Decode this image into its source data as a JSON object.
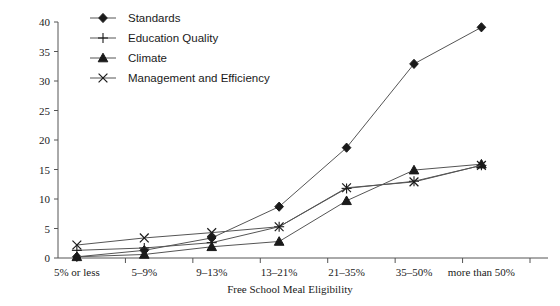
{
  "chart_data": {
    "type": "line",
    "title": "",
    "xlabel": "Free School Meal Eligibility",
    "ylabel": "",
    "ylim": [
      0,
      40
    ],
    "ytick_step": 5,
    "yticks": [
      0,
      5,
      10,
      15,
      20,
      25,
      30,
      35,
      40
    ],
    "grid": false,
    "legend_position": "top-left",
    "categories": [
      "5% or less",
      "5–9%",
      "9–13%",
      "13–21%",
      "21–35%",
      "35–50%",
      "more than 50%"
    ],
    "series": [
      {
        "name": "Standards",
        "marker": "diamond",
        "color": "#1a1a1a",
        "values": [
          0.2,
          1.3,
          3.4,
          8.7,
          18.7,
          32.9,
          39.1
        ]
      },
      {
        "name": "Education Quality",
        "marker": "plus",
        "color": "#1a1a1a",
        "values": [
          1.3,
          1.7,
          2.6,
          5.3,
          11.8,
          13.0,
          15.7
        ]
      },
      {
        "name": "Climate",
        "marker": "triangle",
        "color": "#1a1a1a",
        "values": [
          0.2,
          0.6,
          1.9,
          2.8,
          9.7,
          14.9,
          15.9
        ]
      },
      {
        "name": "Management and Efficiency",
        "marker": "x",
        "color": "#1a1a1a",
        "values": [
          2.2,
          3.4,
          4.3,
          5.3,
          11.9,
          12.9,
          15.7
        ]
      }
    ]
  },
  "legend": {
    "items": [
      {
        "label": "Standards",
        "marker": "diamond-marker"
      },
      {
        "label": "Education Quality",
        "marker": "plus-marker"
      },
      {
        "label": "Climate",
        "marker": "triangle-marker"
      },
      {
        "label": "Management and Efficiency",
        "marker": "x-marker"
      }
    ]
  },
  "axes": {
    "y_tick_labels": [
      "0",
      "5",
      "10",
      "15",
      "20",
      "25",
      "30",
      "35",
      "40"
    ],
    "x_tick_labels": [
      "5% or less",
      "5–9%",
      "9–13%",
      "13–21%",
      "21–35%",
      "35–50%",
      "more than 50%"
    ],
    "x_axis_title": "Free School Meal Eligibility"
  }
}
